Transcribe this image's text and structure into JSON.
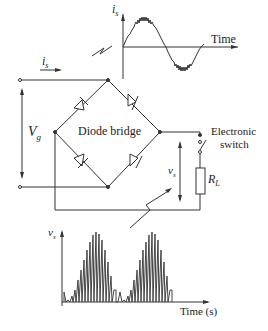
{
  "top_plot": {
    "y_label": "i",
    "y_sub": "s",
    "x_label": "Time"
  },
  "circuit": {
    "input_current_label": "i",
    "input_current_sub": "s",
    "source_voltage_label": "V",
    "source_voltage_sub": "g",
    "bridge_label": "Diode bridge",
    "switch_label_line1": "Electronic",
    "switch_label_line2": "switch",
    "output_voltage_label": "v",
    "output_voltage_sub": "s",
    "load_label": "R",
    "load_sub": "L"
  },
  "bottom_plot": {
    "y_label": "v",
    "y_sub": "s",
    "x_label": "Time (s)"
  },
  "colors": {
    "line": "#333333",
    "bars": "#444444"
  }
}
